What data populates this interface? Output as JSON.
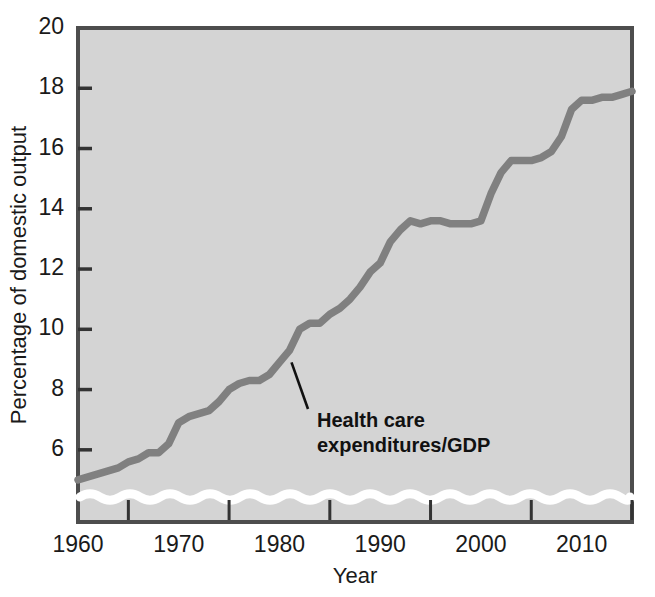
{
  "chart_data": {
    "type": "line",
    "title": "",
    "xlabel": "Year",
    "ylabel": "Percentage of domestic output",
    "xlim": [
      1960,
      2015
    ],
    "ylim": [
      4.6,
      20
    ],
    "grid": false,
    "legend_position": "none",
    "axis_break": {
      "present": true,
      "style": "wavy-white-band",
      "location": "y-axis-bottom",
      "description": "Wavy white break band across the plot just above the x-axis indicating the y-scale does not start at zero"
    },
    "y_ticks": [
      6,
      8,
      10,
      12,
      14,
      16,
      18,
      20
    ],
    "y_tick_labels": [
      "6",
      "8",
      "10",
      "12",
      "14",
      "16",
      "18",
      "20"
    ],
    "x_ticks_labeled": [
      1960,
      1970,
      1980,
      1990,
      2000,
      2010
    ],
    "x_tick_labels": [
      "1960",
      "1970",
      "1980",
      "1990",
      "2000",
      "2010"
    ],
    "x_ticks_minor": [
      1965,
      1975,
      1985,
      1995,
      2005,
      2015
    ],
    "series": [
      {
        "name": "Health care expenditures/GDP",
        "color": "#808080",
        "x": [
          1960,
          1961,
          1962,
          1963,
          1964,
          1965,
          1966,
          1967,
          1968,
          1969,
          1970,
          1971,
          1972,
          1973,
          1974,
          1975,
          1976,
          1977,
          1978,
          1979,
          1980,
          1981,
          1982,
          1983,
          1984,
          1985,
          1986,
          1987,
          1988,
          1989,
          1990,
          1991,
          1992,
          1993,
          1994,
          1995,
          1996,
          1997,
          1998,
          1999,
          2000,
          2001,
          2002,
          2003,
          2004,
          2005,
          2006,
          2007,
          2008,
          2009,
          2010,
          2011,
          2012,
          2013,
          2014,
          2015
        ],
        "values": [
          5.0,
          5.1,
          5.2,
          5.3,
          5.4,
          5.6,
          5.7,
          5.9,
          5.9,
          6.2,
          6.9,
          7.1,
          7.2,
          7.3,
          7.6,
          8.0,
          8.2,
          8.3,
          8.3,
          8.5,
          8.9,
          9.3,
          10.0,
          10.2,
          10.2,
          10.5,
          10.7,
          11.0,
          11.4,
          11.9,
          12.2,
          12.9,
          13.3,
          13.6,
          13.5,
          13.6,
          13.6,
          13.5,
          13.5,
          13.5,
          13.6,
          14.5,
          15.2,
          15.6,
          15.6,
          15.6,
          15.7,
          15.9,
          16.4,
          17.3,
          17.6,
          17.6,
          17.7,
          17.7,
          17.8,
          17.9
        ]
      }
    ],
    "annotations": [
      {
        "name": "series-callout",
        "text_line_1": "Health care",
        "text_line_2": "expenditures/GDP",
        "points_to_year": 1981,
        "points_to_value": 9.3
      }
    ]
  },
  "style": {
    "plot_background": "#d4d4d4",
    "plot_border": "#4d4d4d",
    "line_color": "#808080",
    "break_band_color": "#ffffff",
    "text_color": "#1a1a1a",
    "tick_color": "#333333"
  }
}
